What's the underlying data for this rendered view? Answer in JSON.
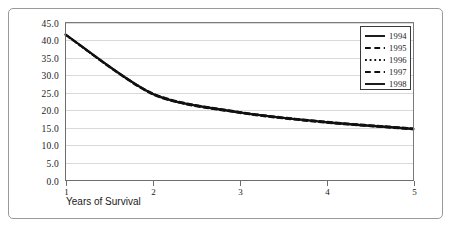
{
  "chart_data": {
    "type": "line",
    "title": "",
    "subtitle": "",
    "xlabel": "Years of Survival",
    "ylabel": "",
    "xlim": [
      1,
      5
    ],
    "ylim": [
      0.0,
      45.0
    ],
    "grid": true,
    "legend_position": "top-right",
    "x": [
      1,
      2,
      3,
      4,
      5
    ],
    "x_tick_labels": [
      "1",
      "2",
      "3",
      "4",
      "5"
    ],
    "y_tick_labels": [
      "0.0",
      "5.0",
      "10.0",
      "15.0",
      "20.0",
      "25.0",
      "30.0",
      "35.0",
      "40.0",
      "45.0"
    ],
    "y_tick_values": [
      0.0,
      5.0,
      10.0,
      15.0,
      20.0,
      25.0,
      30.0,
      35.0,
      40.0,
      45.0
    ],
    "series": [
      {
        "name": "1994",
        "style": "solid",
        "values": [
          41.5,
          24.6,
          19.3,
          16.5,
          14.6
        ]
      },
      {
        "name": "1995",
        "style": "dashed",
        "values": [
          41.6,
          24.9,
          19.6,
          16.8,
          14.9
        ]
      },
      {
        "name": "1996",
        "style": "dotted",
        "values": [
          41.4,
          24.7,
          19.4,
          16.6,
          14.7
        ]
      },
      {
        "name": "1997",
        "style": "dashed",
        "values": [
          41.5,
          24.5,
          19.2,
          16.4,
          14.5
        ]
      },
      {
        "name": "1998",
        "style": "solid",
        "values": [
          41.7,
          24.8,
          19.5,
          16.7,
          14.8
        ]
      }
    ]
  },
  "axes": {
    "x_title": "Years of Survival"
  },
  "legend": {
    "entries": [
      {
        "label": "1994"
      },
      {
        "label": "1995"
      },
      {
        "label": "1996"
      },
      {
        "label": "1997"
      },
      {
        "label": "1998"
      }
    ]
  },
  "colors": {
    "series_line": "#111111",
    "gridline": "#d9d9d9",
    "axis": "#6e6e6e",
    "frame": "#9a9a9a",
    "background": "#ffffff",
    "text": "#1a1a1a"
  }
}
